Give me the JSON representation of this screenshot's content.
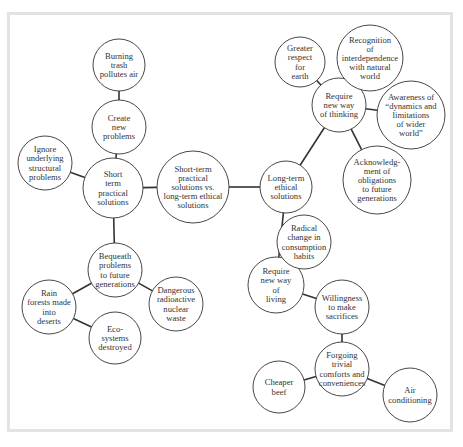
{
  "diagram": {
    "type": "concept-map",
    "colors": {
      "stroke": "#333333",
      "frame": "#e3e3e3",
      "text": "#333333",
      "background": "#ffffff"
    },
    "nodes": [
      {
        "id": "center",
        "cx": 193,
        "cy": 187,
        "r": 36,
        "lines": [
          "Short-term",
          "practical",
          "solutions vs.",
          "long-term ethical",
          "solutions"
        ]
      },
      {
        "id": "short-term",
        "cx": 113,
        "cy": 188,
        "r": 30,
        "lines": [
          "Short",
          "term",
          "practical",
          "solutions"
        ]
      },
      {
        "id": "create-new-problems",
        "cx": 119,
        "cy": 127,
        "r": 27,
        "lines": [
          "Create",
          "new",
          "problems"
        ]
      },
      {
        "id": "burning-trash",
        "cx": 119,
        "cy": 65,
        "r": 26,
        "lines": [
          "Burning",
          "trash",
          "pollutes air"
        ]
      },
      {
        "id": "ignore-underlying",
        "cx": 45,
        "cy": 163,
        "r": 27,
        "lines": [
          "Ignore",
          "underlying",
          "structural",
          "problems"
        ]
      },
      {
        "id": "bequeath",
        "cx": 115,
        "cy": 270,
        "r": 27,
        "lines": [
          "Bequeath",
          "problems",
          "to future",
          "generations"
        ]
      },
      {
        "id": "rain-forests",
        "cx": 49,
        "cy": 307,
        "r": 27,
        "lines": [
          "Rain",
          "forests made",
          "into",
          "deserts"
        ]
      },
      {
        "id": "ecosystems",
        "cx": 115,
        "cy": 338,
        "r": 26,
        "lines": [
          "Eco-",
          "systems",
          "destroyed"
        ]
      },
      {
        "id": "dangerous-waste",
        "cx": 176,
        "cy": 304,
        "r": 27,
        "lines": [
          "Dangerous",
          "radioactive",
          "nuclear",
          "waste"
        ]
      },
      {
        "id": "long-term",
        "cx": 286,
        "cy": 187,
        "r": 26,
        "lines": [
          "Long-term",
          "ethical",
          "solutions"
        ]
      },
      {
        "id": "new-way-thinking",
        "cx": 339,
        "cy": 105,
        "r": 27,
        "lines": [
          "Require",
          "new way",
          "of thinking"
        ]
      },
      {
        "id": "greater-respect",
        "cx": 300,
        "cy": 62,
        "r": 25,
        "lines": [
          "Greater",
          "respect",
          "for",
          "earth"
        ]
      },
      {
        "id": "recognition",
        "cx": 370,
        "cy": 58,
        "r": 33,
        "lines": [
          "Recognition",
          "of",
          "interdependence",
          "with natural",
          "world"
        ]
      },
      {
        "id": "awareness",
        "cx": 411,
        "cy": 115,
        "r": 34,
        "lines": [
          "Awareness of",
          "“dynamics and",
          "limitations",
          "of wider",
          "world”"
        ]
      },
      {
        "id": "acknowledgment",
        "cx": 377,
        "cy": 180,
        "r": 34,
        "lines": [
          "Acknowledg-",
          "ment of",
          "obligations",
          "to future",
          "generations"
        ]
      },
      {
        "id": "new-way-living",
        "cx": 276,
        "cy": 285,
        "r": 28,
        "lines": [
          "Require",
          "new way",
          "of",
          "living"
        ]
      },
      {
        "id": "radical-change",
        "cx": 304,
        "cy": 242,
        "r": 27,
        "lines": [
          "Radical",
          "change in",
          "consumption",
          "habits"
        ]
      },
      {
        "id": "willingness",
        "cx": 342,
        "cy": 307,
        "r": 27,
        "lines": [
          "Willingness",
          "to make",
          "sacrifices"
        ]
      },
      {
        "id": "forgoing",
        "cx": 342,
        "cy": 369,
        "r": 27,
        "lines": [
          "Forgoing",
          "trivial",
          "comforts and",
          "conveniences"
        ]
      },
      {
        "id": "cheaper-beef",
        "cx": 279,
        "cy": 387,
        "r": 26,
        "lines": [
          "Cheaper",
          "beef"
        ]
      },
      {
        "id": "air-conditioning",
        "cx": 410,
        "cy": 395,
        "r": 27,
        "lines": [
          "Air",
          "conditioning"
        ]
      }
    ],
    "edges": [
      [
        "center",
        "short-term"
      ],
      [
        "center",
        "long-term"
      ],
      [
        "short-term",
        "create-new-problems"
      ],
      [
        "create-new-problems",
        "burning-trash"
      ],
      [
        "short-term",
        "ignore-underlying"
      ],
      [
        "short-term",
        "bequeath"
      ],
      [
        "bequeath",
        "rain-forests"
      ],
      [
        "rain-forests",
        "ecosystems"
      ],
      [
        "bequeath",
        "dangerous-waste"
      ],
      [
        "long-term",
        "new-way-thinking"
      ],
      [
        "new-way-thinking",
        "greater-respect"
      ],
      [
        "new-way-thinking",
        "recognition"
      ],
      [
        "new-way-thinking",
        "awareness"
      ],
      [
        "new-way-thinking",
        "acknowledgment"
      ],
      [
        "long-term",
        "new-way-living"
      ],
      [
        "new-way-living",
        "radical-change"
      ],
      [
        "new-way-living",
        "willingness"
      ],
      [
        "willingness",
        "forgoing"
      ],
      [
        "forgoing",
        "cheaper-beef"
      ],
      [
        "forgoing",
        "air-conditioning"
      ]
    ]
  }
}
